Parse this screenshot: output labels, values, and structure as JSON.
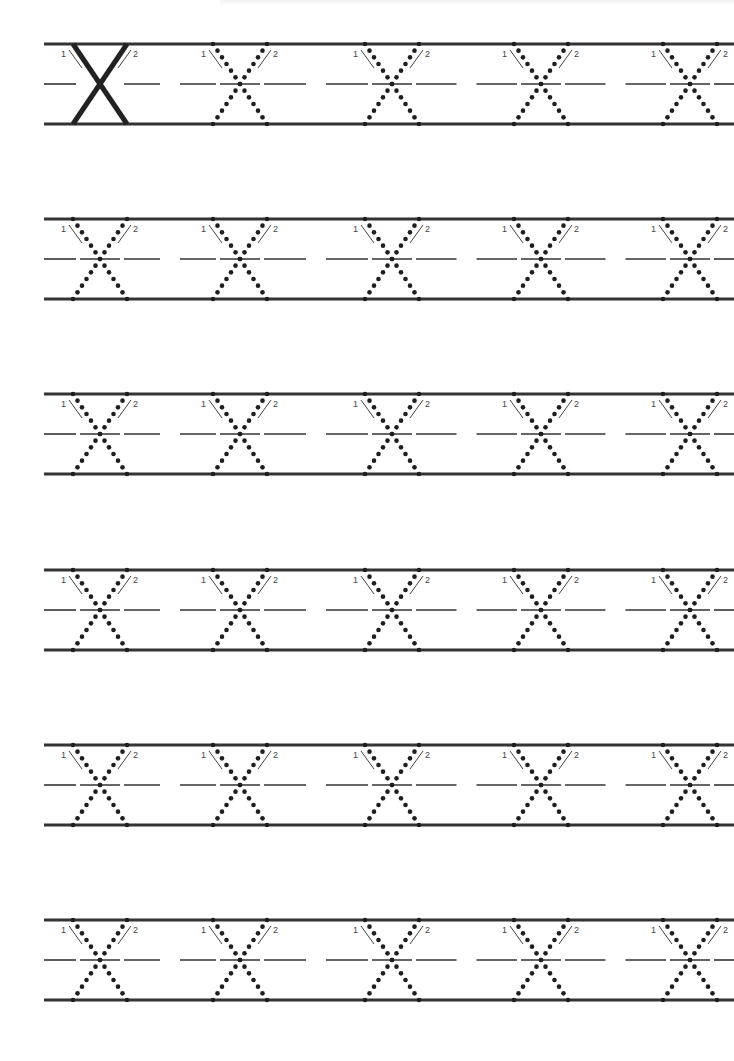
{
  "worksheet": {
    "letter": "X",
    "stroke_labels": [
      "1",
      "2"
    ],
    "rows": 6,
    "letters_per_row": 5,
    "row_tops": [
      44,
      219,
      394,
      570,
      745,
      920
    ],
    "row_height": 80,
    "line_left": 44,
    "line_right": 734,
    "letter_centers_x": [
      100,
      240,
      392,
      541,
      690
    ],
    "letter_half_width_top": 27,
    "first_letter_solid": true,
    "colors": {
      "line": "#333333",
      "letter": "#222222",
      "dots": "#1e1e1e",
      "arrow": "#444444",
      "background": "#ffffff"
    }
  }
}
